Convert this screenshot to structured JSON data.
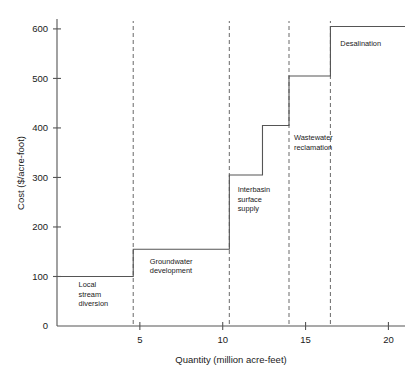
{
  "chart_data": {
    "type": "bar",
    "subtype": "step-supply-curve",
    "title": "",
    "xlabel": "Quantity (million acre-feet)",
    "ylabel": "Cost ($/acre-foot)",
    "xlim": [
      0,
      21
    ],
    "ylim": [
      0,
      620
    ],
    "xticks": [
      5,
      10,
      15,
      20
    ],
    "xtick_labels": [
      "5",
      "10",
      "15",
      "20"
    ],
    "yticks": [
      0,
      100,
      200,
      300,
      400,
      500,
      600
    ],
    "ytick_labels": [
      "0",
      "100",
      "200",
      "300",
      "400",
      "500",
      "600"
    ],
    "grid": false,
    "legend": "none",
    "steps": [
      {
        "name": "Local stream diversion",
        "label_lines": [
          "Local",
          "stream",
          "diversion"
        ],
        "x_start": 0.0,
        "x_end": 4.6,
        "cost": 100
      },
      {
        "name": "Groundwater development",
        "label_lines": [
          "Groundwater",
          "development"
        ],
        "x_start": 4.6,
        "x_end": 10.4,
        "cost": 155
      },
      {
        "name": "Interbasin surface supply",
        "label_lines": [
          "Interbasin",
          "surface",
          "supply"
        ],
        "x_start": 10.4,
        "x_end": 12.4,
        "cost": 305
      },
      {
        "name": "Interbasin surface supply (upper)",
        "label_lines": [],
        "x_start": 12.4,
        "x_end": 14.0,
        "cost": 405
      },
      {
        "name": "Wastewater reclamation",
        "label_lines": [
          "Wastewater",
          "reclamation"
        ],
        "x_start": 14.0,
        "x_end": 16.5,
        "cost": 505
      },
      {
        "name": "Desalination",
        "label_lines": [
          "Desalination"
        ],
        "x_start": 16.5,
        "x_end": 21.0,
        "cost": 605
      }
    ],
    "dividers": [
      4.6,
      10.4,
      14.0,
      16.5
    ],
    "annotations": [
      {
        "text": "Local stream diversion",
        "lines": [
          "Local",
          "stream",
          "diversion"
        ],
        "x": 1.3,
        "y": 78
      },
      {
        "text": "Groundwater development",
        "lines": [
          "Groundwater",
          "development"
        ],
        "x": 5.6,
        "y": 125
      },
      {
        "text": "Interbasin surface supply",
        "lines": [
          "Interbasin",
          "surface",
          "supply"
        ],
        "x": 10.9,
        "y": 270
      },
      {
        "text": "Wastewater reclamation",
        "lines": [
          "Wastewater",
          "reclamation"
        ],
        "x": 14.3,
        "y": 375
      },
      {
        "text": "Desalination",
        "lines": [
          "Desalination"
        ],
        "x": 17.1,
        "y": 565
      }
    ],
    "colors": {
      "line": "#555555",
      "divider": "#777777",
      "text": "#1a1a1a",
      "background": "#ffffff"
    }
  }
}
